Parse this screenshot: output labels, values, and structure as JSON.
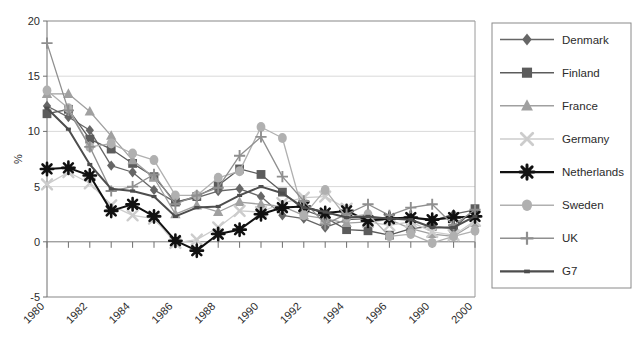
{
  "chart_data": {
    "type": "line",
    "title": "",
    "xlabel": "",
    "ylabel": "%",
    "ylim": [
      -5,
      20
    ],
    "yticks": [
      -5,
      0,
      5,
      10,
      15,
      20
    ],
    "ytick_labels": [
      "-5",
      "0",
      "5",
      "10",
      "15",
      "20"
    ],
    "grid": true,
    "legend_position": "right",
    "x": [
      1980,
      1981,
      1982,
      1983,
      1984,
      1985,
      1986,
      1987,
      1988,
      1989,
      1990,
      1991,
      1992,
      1993,
      1994,
      1995,
      1996,
      1997,
      1998,
      1999,
      2000
    ],
    "xtick_labels": [
      "1980",
      "1982",
      "1984",
      "1986",
      "1988",
      "1990",
      "1992",
      "1994",
      "1996",
      "1990",
      "2000"
    ],
    "xtick_values": [
      1980,
      1982,
      1984,
      1986,
      1988,
      1990,
      1992,
      1994,
      1996,
      1998,
      2000
    ],
    "series": [
      {
        "name": "Denmark",
        "marker": "diamond",
        "color": "#666666",
        "values": [
          12.3,
          11.3,
          10.1,
          6.9,
          6.3,
          4.7,
          3.6,
          4.0,
          4.6,
          4.8,
          4.1,
          2.4,
          2.1,
          1.3,
          2.0,
          2.1,
          2.1,
          2.2,
          1.9,
          2.5,
          2.9
        ]
      },
      {
        "name": "Finland",
        "marker": "square",
        "color": "#5c5c5c",
        "values": [
          11.6,
          12.0,
          9.3,
          8.4,
          7.1,
          5.9,
          3.6,
          4.1,
          5.1,
          6.6,
          6.1,
          4.5,
          2.9,
          2.2,
          1.1,
          1.0,
          0.6,
          1.2,
          1.4,
          1.2,
          3.0
        ]
      },
      {
        "name": "France",
        "marker": "triangle",
        "color": "#a0a0a0",
        "values": [
          13.4,
          13.4,
          11.8,
          9.6,
          7.4,
          5.8,
          2.5,
          3.3,
          2.7,
          3.6,
          3.4,
          3.2,
          2.4,
          2.1,
          1.7,
          1.8,
          2.0,
          1.2,
          0.7,
          0.5,
          1.7
        ]
      },
      {
        "name": "Germany",
        "marker": "x",
        "color": "#cccccc",
        "values": [
          5.2,
          6.3,
          5.3,
          3.3,
          2.4,
          2.1,
          -0.1,
          0.2,
          1.3,
          2.8,
          2.7,
          3.5,
          4.0,
          4.1,
          3.0,
          1.8,
          1.5,
          1.8,
          0.9,
          0.6,
          1.9
        ]
      },
      {
        "name": "Netherlands",
        "marker": "star",
        "color": "#111111",
        "values": [
          6.6,
          6.7,
          6.0,
          2.8,
          3.4,
          2.3,
          0.1,
          -0.8,
          0.7,
          1.1,
          2.5,
          3.1,
          3.2,
          2.6,
          2.8,
          1.9,
          2.1,
          2.2,
          2.0,
          2.2,
          2.3
        ]
      },
      {
        "name": "Sweden",
        "marker": "circle",
        "color": "#b0b0b0",
        "values": [
          13.7,
          12.1,
          8.6,
          8.9,
          8.0,
          7.4,
          4.2,
          4.2,
          5.8,
          6.4,
          10.4,
          9.4,
          2.4,
          4.7,
          2.2,
          2.5,
          0.5,
          0.7,
          -0.1,
          0.5,
          1.0
        ]
      },
      {
        "name": "UK",
        "marker": "plus",
        "color": "#8f8f8f",
        "values": [
          18.0,
          11.9,
          8.6,
          4.6,
          5.0,
          6.1,
          3.4,
          4.2,
          4.9,
          7.8,
          9.5,
          5.9,
          3.7,
          1.6,
          2.5,
          3.4,
          2.4,
          3.1,
          3.4,
          1.5,
          2.9
        ]
      },
      {
        "name": "G7",
        "marker": "small-square",
        "color": "#4d4d4d",
        "values": [
          12.1,
          10.2,
          7.0,
          4.8,
          4.6,
          4.1,
          2.3,
          3.1,
          3.2,
          4.2,
          5.0,
          4.4,
          3.1,
          2.7,
          2.2,
          2.3,
          2.1,
          2.0,
          1.3,
          1.3,
          2.3
        ]
      }
    ]
  },
  "axes": {
    "y_axis_title": "%"
  }
}
